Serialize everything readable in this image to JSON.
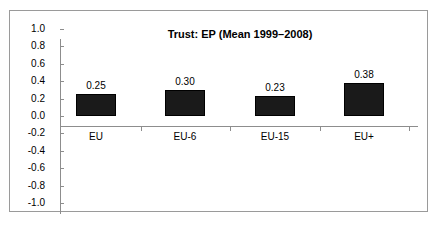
{
  "chart_data": {
    "type": "bar",
    "title": "Trust: EP (Mean 1999–2008)",
    "xlabel": "",
    "ylabel": "",
    "categories": [
      "EU",
      "EU-6",
      "EU-15",
      "EU+"
    ],
    "values": [
      0.25,
      0.3,
      0.23,
      0.38
    ],
    "value_labels": [
      "0.25",
      "0.30",
      "0.23",
      "0.38"
    ],
    "series": [
      {
        "name": "Trust: EP (Mean 1999–2008)",
        "values": [
          0.25,
          0.3,
          0.23,
          0.38
        ]
      }
    ],
    "ylim": [
      -1.0,
      1.0
    ],
    "ytick_step": 0.2,
    "ytick_labels": [
      "1.0",
      "0.8",
      "0.6",
      "0.4",
      "0.2",
      "0.0",
      "-0.2",
      "-0.4",
      "-0.6",
      "-0.8",
      "-1.0"
    ],
    "ytick_values": [
      1.0,
      0.8,
      0.6,
      0.4,
      0.2,
      0.0,
      -0.2,
      -0.4,
      -0.6,
      -0.8,
      -1.0
    ],
    "grid": false,
    "legend": false,
    "legend_position": "none",
    "annotations": [],
    "colors": {
      "bar_fill": "#1a1a1a",
      "bar_border": "#000000",
      "axis": "#8d8d8d",
      "frame": "#9a9a9a",
      "background": "#ffffff",
      "text": "#000000"
    }
  }
}
